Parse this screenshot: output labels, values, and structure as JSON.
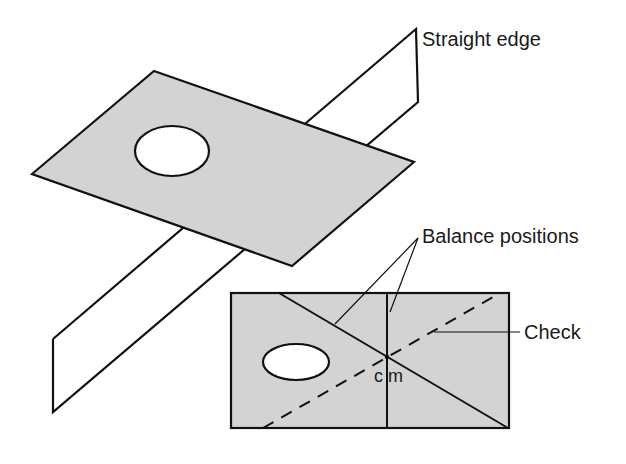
{
  "figure": {
    "labels": {
      "straight_edge": "Straight edge",
      "balance_positions": "Balance positions",
      "check": "Check",
      "cm": "c m"
    },
    "colors": {
      "background": "#ffffff",
      "plate_fill": "#d3d3d3",
      "stroke": "#111111"
    }
  }
}
